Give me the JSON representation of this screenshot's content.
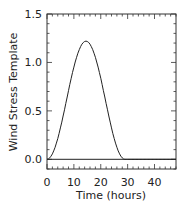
{
  "chart_data": {
    "type": "line",
    "title": "",
    "xlabel": "Time (hours)",
    "ylabel": "Wind Stress Template",
    "xlim": [
      0,
      48
    ],
    "ylim": [
      -0.1,
      1.5
    ],
    "x_ticks": [
      0,
      10,
      20,
      30,
      40
    ],
    "x_tick_labels": [
      "0",
      "10",
      "20",
      "30",
      "40"
    ],
    "y_ticks": [
      0.0,
      0.5,
      1.0,
      1.5
    ],
    "y_tick_labels": [
      "0.0",
      "0.5",
      "1.0",
      "1.5"
    ],
    "grid": false,
    "legend": null,
    "series": [
      {
        "name": "wind stress template",
        "color": "#222222",
        "x": [
          0,
          2,
          4,
          6,
          8,
          10,
          12,
          14,
          15,
          16,
          18,
          20,
          22,
          24,
          26,
          28,
          29,
          30,
          35,
          40,
          45,
          48
        ],
        "y": [
          0.0,
          0.05,
          0.19,
          0.4,
          0.64,
          0.88,
          1.08,
          1.2,
          1.22,
          1.2,
          1.08,
          0.88,
          0.64,
          0.4,
          0.19,
          0.05,
          0.0,
          0.0,
          0.0,
          0.0,
          0.0,
          0.0
        ]
      },
      {
        "name": "zero line",
        "color": "#222222",
        "x": [
          0,
          48
        ],
        "y": [
          0,
          0
        ]
      }
    ]
  }
}
